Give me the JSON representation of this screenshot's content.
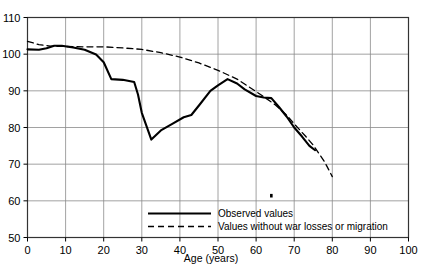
{
  "chart_data": {
    "type": "line",
    "title": "",
    "subtitle": "",
    "xlabel": "Age (years)",
    "ylabel": "",
    "xlim": [
      0,
      100
    ],
    "ylim": [
      50,
      110
    ],
    "xticks": [
      0,
      10,
      20,
      30,
      40,
      50,
      60,
      70,
      80,
      90,
      100
    ],
    "yticks": [
      50,
      60,
      70,
      80,
      90,
      100,
      110
    ],
    "xtick_labels": [
      "0",
      "10",
      "20",
      "30",
      "40",
      "50",
      "60",
      "70",
      "80",
      "90",
      "100"
    ],
    "ytick_labels": [
      "50",
      "60",
      "70",
      "80",
      "90",
      "100",
      "110"
    ],
    "grid": true,
    "legend_position": "inside-bottom-center",
    "series": [
      {
        "name": "Observed values",
        "style": "solid",
        "color": "#000000",
        "points": [
          [
            0,
            101.3
          ],
          [
            3,
            101.2
          ],
          [
            5,
            101.6
          ],
          [
            7,
            102.3
          ],
          [
            9,
            102.3
          ],
          [
            12,
            101.8
          ],
          [
            15,
            101.2
          ],
          [
            18,
            99.9
          ],
          [
            20,
            97.8
          ],
          [
            22,
            93.2
          ],
          [
            25,
            93.0
          ],
          [
            28,
            92.4
          ],
          [
            29,
            89.0
          ],
          [
            30,
            84.0
          ],
          [
            32.5,
            76.7
          ],
          [
            35,
            79.2
          ],
          [
            38,
            81.0
          ],
          [
            41,
            82.8
          ],
          [
            43,
            83.4
          ],
          [
            45,
            86.0
          ],
          [
            48,
            90.0
          ],
          [
            50,
            91.5
          ],
          [
            52.5,
            93.2
          ],
          [
            55,
            92.0
          ],
          [
            57,
            90.4
          ],
          [
            60,
            88.6
          ],
          [
            62,
            88.2
          ],
          [
            64,
            88.0
          ],
          [
            66,
            85.6
          ],
          [
            68,
            83.0
          ],
          [
            70,
            80.0
          ],
          [
            72,
            77.6
          ],
          [
            74,
            75.0
          ],
          [
            75.5,
            73.8
          ]
        ]
      },
      {
        "name": "Values without war losses or migration",
        "style": "dashed",
        "color": "#000000",
        "points": [
          [
            0,
            103.5
          ],
          [
            3,
            102.6
          ],
          [
            6,
            102.2
          ],
          [
            10,
            102.1
          ],
          [
            15,
            102.0
          ],
          [
            20,
            102.0
          ],
          [
            25,
            101.7
          ],
          [
            30,
            101.3
          ],
          [
            35,
            100.4
          ],
          [
            40,
            99.2
          ],
          [
            45,
            97.6
          ],
          [
            50,
            95.6
          ],
          [
            55,
            93.2
          ],
          [
            60,
            89.8
          ],
          [
            62,
            88.4
          ],
          [
            65,
            86.2
          ],
          [
            68,
            83.4
          ],
          [
            70,
            81.0
          ],
          [
            73,
            77.6
          ],
          [
            75,
            75.2
          ],
          [
            78,
            70.6
          ],
          [
            80,
            66.6
          ]
        ]
      }
    ],
    "annotations": [
      {
        "name": "stray-mark",
        "x": 64,
        "y": 61.4,
        "text": ""
      }
    ]
  },
  "legend": {
    "items": [
      {
        "label": "Observed values",
        "style": "solid"
      },
      {
        "label": "Values without war losses or migration",
        "style": "dashed"
      }
    ]
  },
  "axes": {
    "x_title": "Age (years)"
  }
}
